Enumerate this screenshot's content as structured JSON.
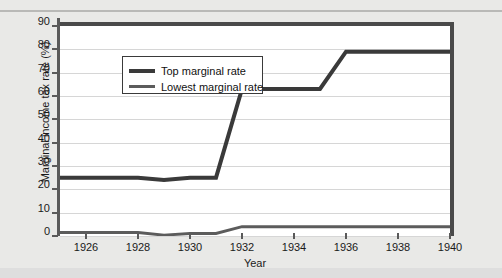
{
  "chart_data": {
    "type": "line",
    "title": "",
    "xlabel": "Year",
    "ylabel": "Marginal income tax rate (%)",
    "xlim": [
      1925,
      1940
    ],
    "ylim": [
      0,
      90
    ],
    "yticks": [
      0,
      10,
      20,
      30,
      40,
      50,
      60,
      70,
      80,
      90
    ],
    "xticks": [
      1926,
      1928,
      1930,
      1932,
      1934,
      1936,
      1938,
      1940
    ],
    "grid": "horizontal",
    "legend_position": "upper-left",
    "x": [
      1925,
      1926,
      1927,
      1928,
      1929,
      1930,
      1931,
      1932,
      1933,
      1934,
      1935,
      1936,
      1937,
      1938,
      1939,
      1940
    ],
    "series": [
      {
        "name": "Top marginal rate",
        "values": [
          25,
          25,
          25,
          25,
          24,
          25,
          25,
          63,
          63,
          63,
          63,
          79,
          79,
          79,
          79,
          79
        ]
      },
      {
        "name": "Lowest marginal rate",
        "values": [
          1.5,
          1.5,
          1.5,
          1.5,
          0.375,
          1.125,
          1.125,
          4,
          4,
          4,
          4,
          4,
          4,
          4,
          4,
          4
        ]
      }
    ],
    "colors": {
      "top_marginal_rate": "#3a3a3a",
      "lowest_marginal_rate": "#5c5c5c",
      "gridline": "#d6d6d6",
      "axis": "#5a5a5a",
      "plot_background": "#ffffff",
      "page_background": "#e9e9e7"
    }
  },
  "axes": {
    "ylabel": "Marginal income tax rate (%)",
    "xlabel": "Year",
    "yticks": [
      "0",
      "10",
      "20",
      "30",
      "40",
      "50",
      "60",
      "70",
      "80",
      "90"
    ],
    "xticks": [
      "1926",
      "1928",
      "1930",
      "1932",
      "1934",
      "1936",
      "1938",
      "1940"
    ]
  },
  "legend": {
    "items": [
      {
        "label": "Top marginal rate"
      },
      {
        "label": "Lowest marginal rate"
      }
    ]
  }
}
